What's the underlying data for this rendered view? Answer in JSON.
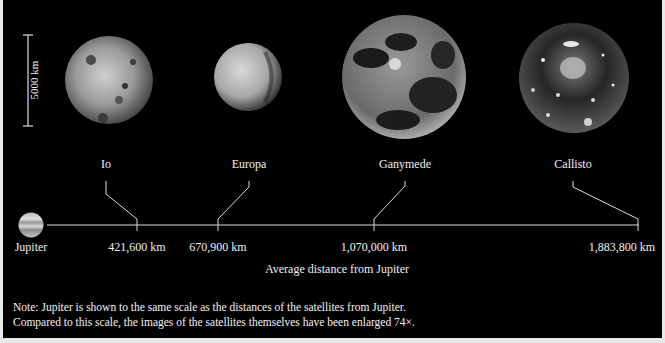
{
  "scale_bar": {
    "label": "5000 km"
  },
  "satellites": [
    {
      "name": "Io",
      "distance": "421,600 km"
    },
    {
      "name": "Europa",
      "distance": "670,900 km"
    },
    {
      "name": "Ganymede",
      "distance": "1,070,000 km"
    },
    {
      "name": "Callisto",
      "distance": "1,883,800 km"
    }
  ],
  "planet": {
    "name": "Jupiter"
  },
  "axis": {
    "caption": "Average distance from Jupiter"
  },
  "note": {
    "line1": "Note: Jupiter is shown to the same scale as the distances of the satellites from Jupiter.",
    "line2": "Compared to this scale, the images of the satellites themselves have been enlarged 74×."
  }
}
